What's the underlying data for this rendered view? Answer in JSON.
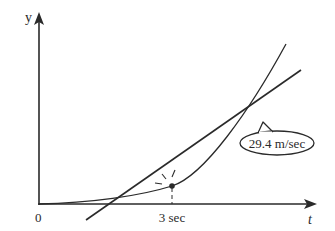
{
  "diagram": {
    "axis_labels": {
      "y": "y",
      "x": "t",
      "origin": "0"
    },
    "tick_label": "3 sec",
    "callout": "29.4 m/sec",
    "elements": [
      "position curve y(t) (parabola from origin)",
      "tangent line at t = 3 sec",
      "dashed vertical line from tangent point to t-axis",
      "highlight rays around tangent point",
      "callout bubble indicating slope"
    ],
    "colors": {
      "ink": "#2a2a2a",
      "background": "#ffffff"
    }
  }
}
